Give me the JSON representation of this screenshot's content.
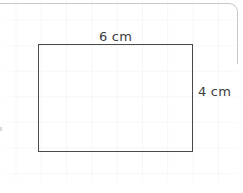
{
  "canvas": {
    "width": 243,
    "height": 193,
    "background_color": "#ffffff",
    "grid_line_color": "#f6f6f7",
    "frame_line_color": "#c9c9cc"
  },
  "figure": {
    "shape": "rectangle",
    "stroke_color": "#4a4a4a",
    "fill": "none",
    "label_color": "#3c3c3c",
    "width_label": "6 cm",
    "height_label": "4 cm",
    "width_value": 6,
    "height_value": 4,
    "unit": "cm"
  }
}
